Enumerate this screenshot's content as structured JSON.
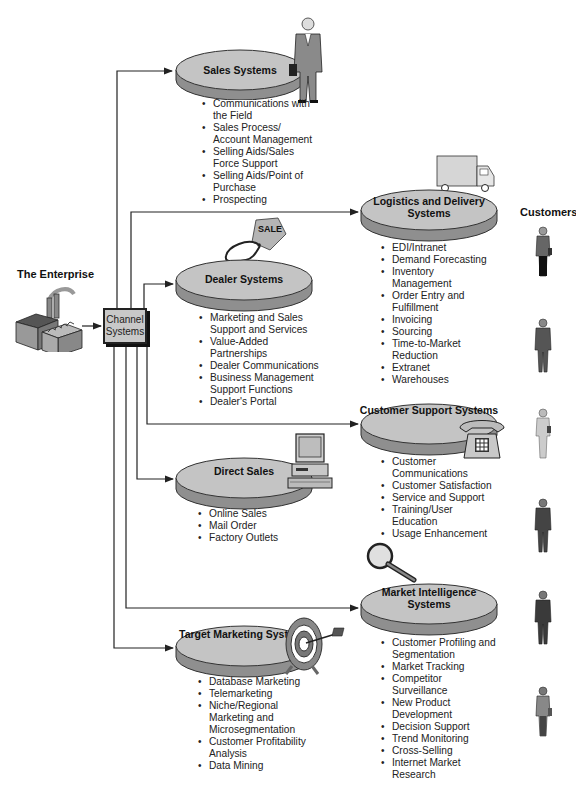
{
  "diagram": {
    "enterprise_label": "The Enterprise",
    "channel_box_label": "Channel Systems",
    "customers_label": "Customers",
    "colors": {
      "disk_top": "#c4c4c4",
      "disk_side": "#8f8f8f",
      "line": "#222222",
      "text": "#222222"
    },
    "systems": [
      {
        "id": "sales",
        "title": "Sales Systems",
        "icon": "salesman-icon",
        "items": [
          "Communications with the Field",
          "Sales Process/ Account Management",
          "Selling Aids/Sales Force Support",
          "Selling Aids/Point of Purchase",
          "Prospecting"
        ]
      },
      {
        "id": "logistics",
        "title": "Logistics and Delivery Systems",
        "icon": "truck-icon",
        "items": [
          "EDI/Intranet",
          "Demand Forecasting",
          "Inventory Management",
          "Order Entry and Fulfillment",
          "Invoicing",
          "Sourcing",
          "Time-to-Market Reduction",
          "Extranet",
          "Warehouses"
        ]
      },
      {
        "id": "dealer",
        "title": "Dealer Systems",
        "icon": "sale-tag-icon",
        "tag_text": "SALE",
        "items": [
          "Marketing and Sales Support and Services",
          "Value-Added Partnerships",
          "Dealer Communications",
          "Business Management Support Functions",
          "Dealer's Portal"
        ]
      },
      {
        "id": "customer_support",
        "title": "Customer Support Systems",
        "icon": "telephone-icon",
        "items": [
          "Customer Communications",
          "Customer Satisfaction",
          "Service and Support",
          "Training/User Education",
          "Usage Enhancement"
        ]
      },
      {
        "id": "direct",
        "title": "Direct Sales",
        "icon": "computer-icon",
        "items": [
          "Online Sales",
          "Mail Order",
          "Factory Outlets"
        ]
      },
      {
        "id": "market_intel",
        "title": "Market Intelligence Systems",
        "icon": "magnifying-glass-icon",
        "items": [
          "Customer Profiling and Segmentation",
          "Market Tracking",
          "Competitor Surveillance",
          "New Product Development",
          "Decision Support",
          "Trend Monitoring",
          "Cross-Selling",
          "Internet Market Research"
        ]
      },
      {
        "id": "target",
        "title": "Target Marketing Systems",
        "icon": "target-arrow-icon",
        "items": [
          "Database Marketing",
          "Telemarketing",
          "Niche/Regional Marketing and Microsegmentation",
          "Customer Profitability Analysis",
          "Data Mining"
        ]
      }
    ],
    "customer_figures": [
      "customer-woman-icon",
      "customer-man-icon",
      "customer-woman-icon",
      "customer-man-icon",
      "customer-man-icon",
      "customer-woman-icon"
    ]
  }
}
